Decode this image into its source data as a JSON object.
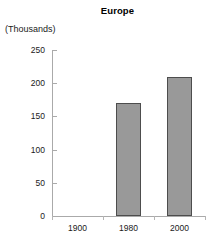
{
  "chart_data": {
    "type": "bar",
    "title": "Europe",
    "xlabel": "",
    "ylabel": "(Thousands)",
    "categories": [
      "1900",
      "1980",
      "2000"
    ],
    "values": [
      0,
      170,
      210
    ],
    "ylim": [
      0,
      250
    ],
    "yticks": [
      0,
      50,
      100,
      150,
      200,
      250
    ],
    "ytick_labels": [
      "0",
      "50",
      "100",
      "150",
      "200",
      "250"
    ],
    "grid": false,
    "legend": null,
    "bar_color": "#999999",
    "bar_border_color": "#4d4d4d",
    "axis_color": "#aaaaaa",
    "background": "#ffffff"
  }
}
